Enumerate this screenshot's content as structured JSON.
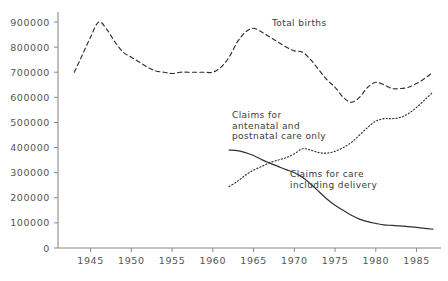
{
  "chart_data": {
    "type": "line",
    "title": "",
    "xlabel": "",
    "ylabel": "",
    "xlim": [
      1941,
      1988
    ],
    "ylim": [
      0,
      920000
    ],
    "grid": false,
    "legend_position": "inline-annotations",
    "x_ticks": [
      1945,
      1950,
      1955,
      1960,
      1965,
      1970,
      1975,
      1980,
      1985
    ],
    "y_ticks": [
      0,
      100000,
      200000,
      300000,
      400000,
      500000,
      600000,
      700000,
      800000,
      900000
    ],
    "x_tick_labels": [
      "1945",
      "1950",
      "1955",
      "1960",
      "1965",
      "1970",
      "1975",
      "1980",
      "1985"
    ],
    "y_tick_labels": [
      "0",
      "100000",
      "200000",
      "300000",
      "400000",
      "500000",
      "600000",
      "700000",
      "800000",
      "900000"
    ],
    "series": [
      {
        "name": "Total births",
        "style": "dashed",
        "color": "#2f2f2f",
        "x": [
          1943,
          1944,
          1945,
          1946,
          1947,
          1948,
          1949,
          1950,
          1951,
          1952,
          1953,
          1954,
          1955,
          1956,
          1957,
          1958,
          1959,
          1960,
          1961,
          1962,
          1963,
          1964,
          1965,
          1966,
          1967,
          1968,
          1969,
          1970,
          1971,
          1972,
          1973,
          1974,
          1975,
          1976,
          1977,
          1978,
          1979,
          1980,
          1981,
          1982,
          1983,
          1984,
          1985,
          1986,
          1987
        ],
        "y": [
          700000,
          770000,
          840000,
          900000,
          870000,
          820000,
          780000,
          760000,
          740000,
          720000,
          705000,
          700000,
          695000,
          700000,
          700000,
          700000,
          700000,
          700000,
          720000,
          760000,
          820000,
          860000,
          875000,
          860000,
          840000,
          820000,
          800000,
          785000,
          780000,
          750000,
          710000,
          670000,
          640000,
          600000,
          580000,
          600000,
          640000,
          660000,
          650000,
          635000,
          635000,
          640000,
          655000,
          675000,
          700000
        ]
      },
      {
        "name": "Claims for antenatal and postnatal care only",
        "style": "dotted",
        "color": "#2f2f2f",
        "x": [
          1962,
          1963,
          1964,
          1965,
          1966,
          1967,
          1968,
          1969,
          1970,
          1971,
          1972,
          1973,
          1974,
          1975,
          1976,
          1977,
          1978,
          1979,
          1980,
          1981,
          1982,
          1983,
          1984,
          1985,
          1986,
          1987
        ],
        "y": [
          245000,
          265000,
          290000,
          310000,
          325000,
          340000,
          350000,
          360000,
          375000,
          395000,
          390000,
          380000,
          378000,
          385000,
          400000,
          420000,
          450000,
          480000,
          505000,
          515000,
          515000,
          520000,
          535000,
          560000,
          590000,
          620000
        ]
      },
      {
        "name": "Claims for care including delivery",
        "style": "solid",
        "color": "#2f2f2f",
        "x": [
          1962,
          1963,
          1964,
          1965,
          1966,
          1967,
          1968,
          1969,
          1970,
          1971,
          1972,
          1973,
          1974,
          1975,
          1976,
          1977,
          1978,
          1979,
          1980,
          1981,
          1982,
          1983,
          1984,
          1985,
          1986,
          1987
        ],
        "y": [
          390000,
          388000,
          380000,
          368000,
          352000,
          338000,
          325000,
          312000,
          300000,
          282000,
          255000,
          225000,
          195000,
          170000,
          150000,
          130000,
          115000,
          105000,
          98000,
          92000,
          90000,
          88000,
          85000,
          82000,
          78000,
          75000
        ]
      }
    ],
    "annotations": [
      {
        "id": "total-births",
        "text": "Total births"
      },
      {
        "id": "antenatal",
        "text": "Claims for\nantenatal and\npostnatal care only"
      },
      {
        "id": "delivery",
        "text": "Claims for care\nincluding delivery"
      }
    ]
  }
}
